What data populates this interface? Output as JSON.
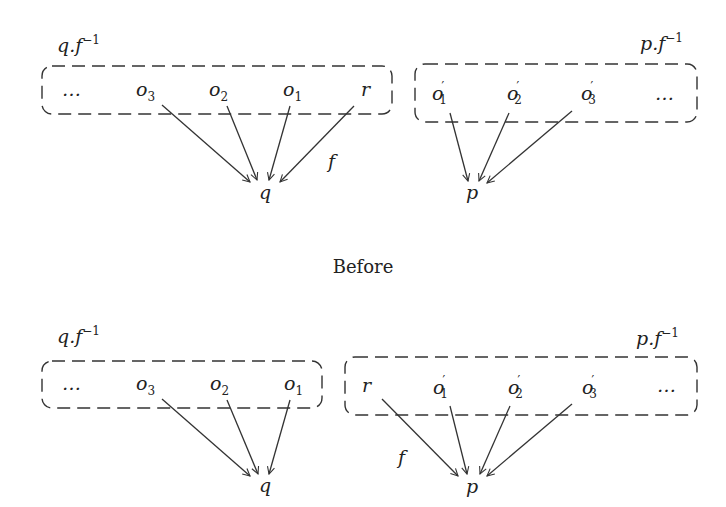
{
  "caption": "Before",
  "top": {
    "left_group": {
      "label": "q.f",
      "label_sup": "−1",
      "items": [
        {
          "name": "…",
          "sub": "",
          "prime": false
        },
        {
          "name": "o",
          "sub": "3",
          "prime": false
        },
        {
          "name": "o",
          "sub": "2",
          "prime": false
        },
        {
          "name": "o",
          "sub": "1",
          "prime": false
        },
        {
          "name": "r",
          "sub": "",
          "prime": false
        }
      ],
      "target": "q",
      "edge_label": "f"
    },
    "right_group": {
      "label": "p.f",
      "label_sup": "−1",
      "items": [
        {
          "name": "o",
          "sub": "1",
          "prime": true
        },
        {
          "name": "o",
          "sub": "2",
          "prime": true
        },
        {
          "name": "o",
          "sub": "3",
          "prime": true
        },
        {
          "name": "…",
          "sub": "",
          "prime": false
        }
      ],
      "target": "p"
    }
  },
  "bottom": {
    "left_group": {
      "label": "q.f",
      "label_sup": "−1",
      "items": [
        {
          "name": "…",
          "sub": "",
          "prime": false
        },
        {
          "name": "o",
          "sub": "3",
          "prime": false
        },
        {
          "name": "o",
          "sub": "2",
          "prime": false
        },
        {
          "name": "o",
          "sub": "1",
          "prime": false
        }
      ],
      "target": "q"
    },
    "right_group": {
      "label": "p.f",
      "label_sup": "−1",
      "items": [
        {
          "name": "r",
          "sub": "",
          "prime": false
        },
        {
          "name": "o",
          "sub": "1",
          "prime": true
        },
        {
          "name": "o",
          "sub": "2",
          "prime": true
        },
        {
          "name": "o",
          "sub": "3",
          "prime": true
        },
        {
          "name": "…",
          "sub": "",
          "prime": false
        }
      ],
      "target": "p",
      "edge_label": "f"
    }
  },
  "colors": {
    "ink": "#222222",
    "background": "#ffffff"
  }
}
